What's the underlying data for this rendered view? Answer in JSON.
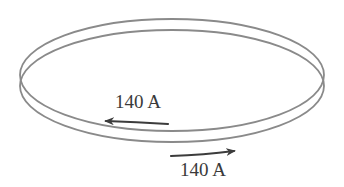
{
  "diagram": {
    "loops": [
      {
        "name": "upper-loop",
        "cx": 172,
        "cy": 75,
        "rx": 152,
        "ry": 56,
        "stroke": "#8a8a8a"
      },
      {
        "name": "lower-loop",
        "cx": 172,
        "cy": 86,
        "rx": 152,
        "ry": 56,
        "stroke": "#8a8a8a"
      }
    ],
    "currents": [
      {
        "loop": "upper-loop",
        "label": "140 A",
        "direction": "left"
      },
      {
        "loop": "lower-loop",
        "label": "140 A",
        "direction": "right"
      }
    ],
    "arrow_color": "#3c3c3c"
  }
}
